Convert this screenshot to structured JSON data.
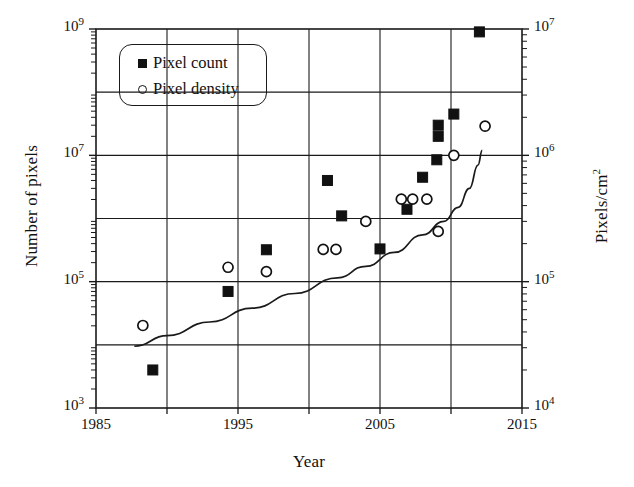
{
  "chart_data": {
    "type": "scatter",
    "title": "",
    "xlabel": "Year",
    "ylabel": "Number of pixels",
    "ylabel_right": "Pixels/cm2",
    "ylabel_right_html": "Pixels/cm<sup>2</sup>",
    "xlim": [
      1985,
      2015
    ],
    "xticks": [
      1985,
      1995,
      2005,
      2015
    ],
    "xticks_minor": [
      1990,
      2000,
      2010
    ],
    "yscale": "log",
    "ylim": [
      1000,
      1000000000
    ],
    "yticks": [
      1000,
      100000,
      10000000,
      1000000000
    ],
    "ytick_labels": [
      "10^3",
      "10^5",
      "10^7",
      "10^9"
    ],
    "ytick_bases": [
      "10",
      "10",
      "10",
      "10"
    ],
    "ytick_exponents": [
      "3",
      "5",
      "7",
      "9"
    ],
    "yscale_right": "log",
    "ylim_right": [
      10000,
      10000000
    ],
    "yticks_right": [
      10000,
      100000,
      1000000,
      10000000
    ],
    "ytick_right_labels": [
      "10^4",
      "10^5",
      "10^6",
      "10^7"
    ],
    "ytick_right_bases": [
      "10",
      "10",
      "10",
      "10"
    ],
    "ytick_right_exponents": [
      "4",
      "5",
      "6",
      "7"
    ],
    "grid": true,
    "grid_x_every_years": 5,
    "grid_y_decades": true,
    "legend_position": "upper left",
    "series": [
      {
        "name": "Pixel count",
        "marker": "filled-square",
        "axis": "left",
        "color": "#111111",
        "points": [
          {
            "x": 1989.0,
            "y": 4000
          },
          {
            "x": 1994.3,
            "y": 70000
          },
          {
            "x": 1997.0,
            "y": 320000
          },
          {
            "x": 2001.3,
            "y": 4000000
          },
          {
            "x": 2002.3,
            "y": 1100000
          },
          {
            "x": 2005.0,
            "y": 330000
          },
          {
            "x": 2006.9,
            "y": 1400000
          },
          {
            "x": 2008.0,
            "y": 4500000
          },
          {
            "x": 2009.0,
            "y": 8500000
          },
          {
            "x": 2009.1,
            "y": 20000000
          },
          {
            "x": 2009.1,
            "y": 30000000
          },
          {
            "x": 2010.2,
            "y": 45000000
          },
          {
            "x": 2012.0,
            "y": 900000000
          }
        ]
      },
      {
        "name": "Pixel density",
        "marker": "open-circle",
        "axis": "right",
        "color": "#111111",
        "points": [
          {
            "x": 1988.3,
            "y": 45000
          },
          {
            "x": 1994.3,
            "y": 130000
          },
          {
            "x": 1997.0,
            "y": 120000
          },
          {
            "x": 2001.0,
            "y": 180000
          },
          {
            "x": 2001.9,
            "y": 180000
          },
          {
            "x": 2004.0,
            "y": 300000
          },
          {
            "x": 2006.5,
            "y": 450000
          },
          {
            "x": 2007.3,
            "y": 450000
          },
          {
            "x": 2008.3,
            "y": 450000
          },
          {
            "x": 2009.1,
            "y": 250000
          },
          {
            "x": 2010.2,
            "y": 1000000
          },
          {
            "x": 2012.4,
            "y": 1700000
          }
        ]
      }
    ],
    "trend_curve": {
      "name": "fitted-trend",
      "description": "exponential trend line rising from ~1989 to ~2012",
      "color": "#111111",
      "points": [
        {
          "x": 1987.7,
          "y": 9500
        },
        {
          "x": 1990.0,
          "y": 14000
        },
        {
          "x": 1993.0,
          "y": 23000
        },
        {
          "x": 1996.0,
          "y": 38000
        },
        {
          "x": 1999.0,
          "y": 65000
        },
        {
          "x": 2002.0,
          "y": 115000
        },
        {
          "x": 2004.0,
          "y": 175000
        },
        {
          "x": 2006.0,
          "y": 290000
        },
        {
          "x": 2008.0,
          "y": 550000
        },
        {
          "x": 2009.5,
          "y": 900000
        },
        {
          "x": 2010.5,
          "y": 1500000
        },
        {
          "x": 2011.3,
          "y": 3000000
        },
        {
          "x": 2011.9,
          "y": 7000000
        },
        {
          "x": 2012.2,
          "y": 12000000
        }
      ]
    }
  },
  "legend": {
    "items": [
      {
        "label": "Pixel count",
        "marker": "filled-square"
      },
      {
        "label": "Pixel density",
        "marker": "open-circle"
      }
    ]
  },
  "axes": {
    "x_title": "Year",
    "y_left_title": "Number of pixels",
    "y_right_title_base": "Pixels/cm",
    "y_right_title_exp": "2"
  }
}
